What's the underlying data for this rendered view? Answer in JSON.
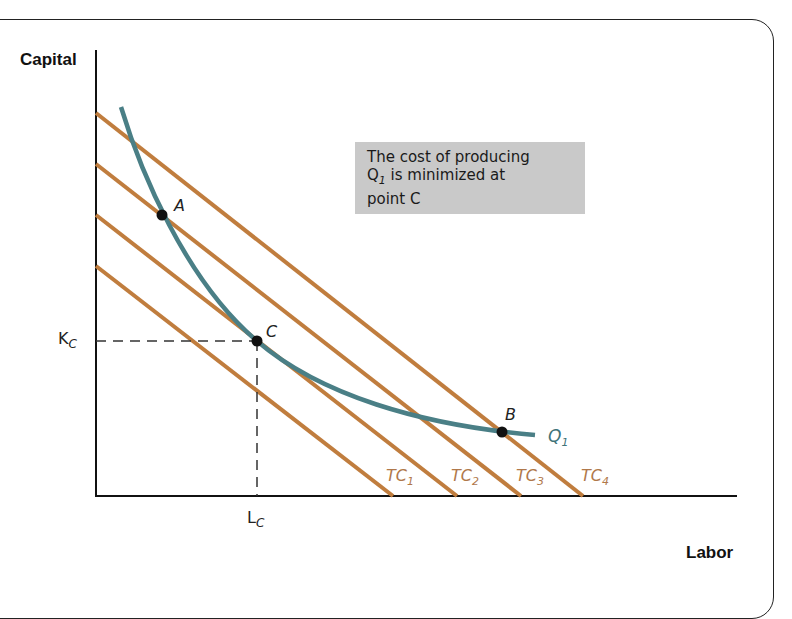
{
  "diagram": {
    "type": "isoquant-isocost",
    "axes": {
      "y_label": "Capital",
      "x_label": "Labor"
    },
    "ticks": {
      "k_label": "K",
      "k_sub": "C",
      "l_label": "L",
      "l_sub": "C"
    },
    "note": {
      "line1": "The cost of producing",
      "line2_q": "Q",
      "line2_sub": "1",
      "line2_rest": " is minimized at",
      "line3": "point C"
    },
    "points": [
      {
        "name": "A",
        "x": 162,
        "y": 215
      },
      {
        "name": "C",
        "x": 257,
        "y": 341
      },
      {
        "name": "B",
        "x": 502,
        "y": 432
      }
    ],
    "isoquant": {
      "label": "Q",
      "sub": "1",
      "color": "#4a7f86"
    },
    "isocost_lines": [
      {
        "label": "TC",
        "sub": "1",
        "y_start": 266,
        "x_end": 393
      },
      {
        "label": "TC",
        "sub": "2",
        "y_start": 215,
        "x_end": 457
      },
      {
        "label": "TC",
        "sub": "3",
        "y_start": 164,
        "x_end": 521
      },
      {
        "label": "TC",
        "sub": "4",
        "y_start": 113,
        "x_end": 583
      }
    ],
    "colors": {
      "isocost": "#c07d3e",
      "isoquant": "#4a7f86",
      "note_bg": "#c9c9c9",
      "tc_label": "#b0784a"
    }
  }
}
